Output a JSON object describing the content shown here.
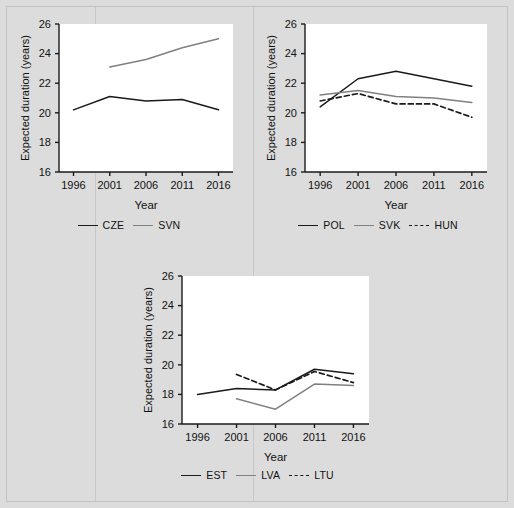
{
  "figure": {
    "background_color": "#dcdcdc",
    "plot_background_color": "#ffffff",
    "axis_color": "#1a1a1a",
    "series_colors": {
      "dark": "#1a1a1a",
      "gray": "#808080"
    }
  },
  "chart_data": [
    {
      "type": "line",
      "panel": "top-left",
      "title": "",
      "xlabel": "Year",
      "ylabel": "Expected duration (years)",
      "x": [
        1996,
        2001,
        2006,
        2011,
        2016
      ],
      "xticks": [
        "1996",
        "2001",
        "2006",
        "2011",
        "2016"
      ],
      "yticks": [
        "16",
        "18",
        "20",
        "22",
        "24",
        "26"
      ],
      "xlim": [
        1994,
        2018
      ],
      "ylim": [
        16,
        26
      ],
      "grid": false,
      "legend_position": "bottom",
      "series": [
        {
          "name": "CZE",
          "color": "#1a1a1a",
          "style": "solid",
          "x": [
            1996,
            2001,
            2006,
            2011,
            2016
          ],
          "values": [
            20.2,
            21.1,
            20.8,
            20.9,
            20.2
          ]
        },
        {
          "name": "SVN",
          "color": "#808080",
          "style": "solid",
          "x": [
            2001,
            2006,
            2011,
            2016
          ],
          "values": [
            23.1,
            23.6,
            24.4,
            25.0
          ]
        }
      ]
    },
    {
      "type": "line",
      "panel": "top-right",
      "title": "",
      "xlabel": "Year",
      "ylabel": "Expected duration (years)",
      "x": [
        1996,
        2001,
        2006,
        2011,
        2016
      ],
      "xticks": [
        "1996",
        "2001",
        "2006",
        "2011",
        "2016"
      ],
      "yticks": [
        "16",
        "18",
        "20",
        "22",
        "24",
        "26"
      ],
      "xlim": [
        1994,
        2018
      ],
      "ylim": [
        16,
        26
      ],
      "grid": false,
      "legend_position": "bottom",
      "series": [
        {
          "name": "POL",
          "color": "#1a1a1a",
          "style": "solid",
          "x": [
            1996,
            2001,
            2006,
            2011,
            2016
          ],
          "values": [
            20.4,
            22.3,
            22.8,
            22.3,
            21.8
          ]
        },
        {
          "name": "SVK",
          "color": "#808080",
          "style": "solid",
          "x": [
            1996,
            2001,
            2006,
            2011,
            2016
          ],
          "values": [
            21.2,
            21.5,
            21.1,
            21.0,
            20.7
          ]
        },
        {
          "name": "HUN",
          "color": "#1a1a1a",
          "style": "dashed",
          "x": [
            1996,
            2001,
            2006,
            2011,
            2016
          ],
          "values": [
            20.8,
            21.3,
            20.6,
            20.6,
            19.7
          ]
        }
      ]
    },
    {
      "type": "line",
      "panel": "bottom-center",
      "title": "",
      "xlabel": "Year",
      "ylabel": "Expected duration (years)",
      "x": [
        1996,
        2001,
        2006,
        2011,
        2016
      ],
      "xticks": [
        "1996",
        "2001",
        "2006",
        "2011",
        "2016"
      ],
      "yticks": [
        "16",
        "18",
        "20",
        "22",
        "24",
        "26"
      ],
      "xlim": [
        1994,
        2018
      ],
      "ylim": [
        16,
        26
      ],
      "grid": false,
      "legend_position": "bottom",
      "series": [
        {
          "name": "EST",
          "color": "#1a1a1a",
          "style": "solid",
          "x": [
            1996,
            2001,
            2006,
            2011,
            2016
          ],
          "values": [
            18.0,
            18.4,
            18.3,
            19.7,
            19.4
          ]
        },
        {
          "name": "LVA",
          "color": "#808080",
          "style": "solid",
          "x": [
            2001,
            2006,
            2011,
            2016
          ],
          "values": [
            17.7,
            17.0,
            18.7,
            18.6
          ]
        },
        {
          "name": "LTU",
          "color": "#1a1a1a",
          "style": "dashed",
          "x": [
            2001,
            2006,
            2011,
            2016
          ],
          "values": [
            19.35,
            18.3,
            19.55,
            18.8
          ]
        }
      ]
    }
  ],
  "panels": [
    {
      "id": "panel-1",
      "xlabel": "Year",
      "ylabel": "Expected duration (years)",
      "legend": [
        {
          "label": "CZE",
          "color": "#1a1a1a",
          "style": "solid"
        },
        {
          "label": "SVN",
          "color": "#808080",
          "style": "solid"
        }
      ]
    },
    {
      "id": "panel-2",
      "xlabel": "Year",
      "ylabel": "Expected duration (years)",
      "legend": [
        {
          "label": "POL",
          "color": "#1a1a1a",
          "style": "solid"
        },
        {
          "label": "SVK",
          "color": "#808080",
          "style": "solid"
        },
        {
          "label": "HUN",
          "color": "#1a1a1a",
          "style": "dashed"
        }
      ]
    },
    {
      "id": "panel-3",
      "xlabel": "Year",
      "ylabel": "Expected duration (years)",
      "legend": [
        {
          "label": "EST",
          "color": "#1a1a1a",
          "style": "solid"
        },
        {
          "label": "LVA",
          "color": "#808080",
          "style": "solid"
        },
        {
          "label": "LTU",
          "color": "#1a1a1a",
          "style": "dashed"
        }
      ]
    }
  ]
}
